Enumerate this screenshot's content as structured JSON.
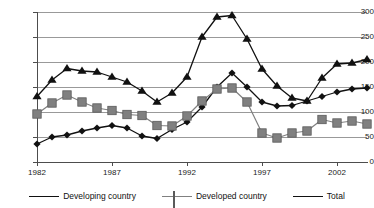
{
  "chart_data": {
    "type": "line",
    "title": "",
    "xlabel": "",
    "ylabel": "",
    "xlim": [
      1982,
      2004
    ],
    "ylim": [
      0,
      300
    ],
    "grid": true,
    "legend_position": "bottom",
    "x": [
      1982,
      1983,
      1984,
      1985,
      1986,
      1987,
      1988,
      1989,
      1990,
      1991,
      1992,
      1993,
      1994,
      1995,
      1996,
      1997,
      1998,
      1999,
      2000,
      2001,
      2002,
      2003,
      2004
    ],
    "xtick_labels": [
      "1982",
      "1987",
      "1992",
      "1997",
      "2002"
    ],
    "xtick_values": [
      1982,
      1987,
      1992,
      1997,
      2002
    ],
    "ytick_labels": [
      "0",
      "50",
      "100",
      "150",
      "200",
      "250",
      "300"
    ],
    "ytick_values": [
      0,
      50,
      100,
      150,
      200,
      250,
      300
    ],
    "series": [
      {
        "name": "Developing country",
        "marker": "diamond",
        "color": "#111111",
        "values": [
          36,
          50,
          54,
          62,
          68,
          73,
          68,
          52,
          47,
          65,
          80,
          110,
          150,
          178,
          150,
          120,
          112,
          113,
          122,
          131,
          140,
          146,
          148
        ]
      },
      {
        "name": "Developed country",
        "marker": "square",
        "color": "#808080",
        "values": [
          96,
          118,
          134,
          120,
          108,
          103,
          95,
          93,
          73,
          72,
          92,
          122,
          146,
          148,
          120,
          58,
          48,
          58,
          62,
          85,
          78,
          82,
          76
        ]
      },
      {
        "name": "Total",
        "marker": "triangle",
        "color": "#111111",
        "values": [
          131,
          164,
          187,
          182,
          180,
          170,
          160,
          142,
          120,
          138,
          170,
          250,
          290,
          293,
          246,
          186,
          152,
          128,
          122,
          168,
          196,
          198,
          205
        ]
      }
    ]
  },
  "legend": {
    "items": [
      {
        "label": "Developing country",
        "marker": "diamond"
      },
      {
        "label": "Developed country",
        "marker": "square"
      },
      {
        "label": "Total",
        "marker": "triangle"
      }
    ]
  }
}
